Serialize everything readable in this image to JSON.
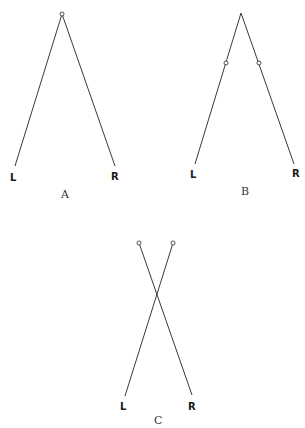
{
  "colors": {
    "line": "#3a3a3a",
    "text": "#1a1a1a",
    "background": "#ffffff"
  },
  "figures": [
    {
      "id": "A",
      "caption": "A",
      "left_label": "L",
      "right_label": "R",
      "description": "Two lines joined at a single pivot at the apex"
    },
    {
      "id": "B",
      "caption": "B",
      "left_label": "L",
      "right_label": "R",
      "description": "Two lines joined at the apex with a pivot on each line partway down"
    },
    {
      "id": "C",
      "caption": "C",
      "left_label": "L",
      "right_label": "R",
      "description": "Two crossing lines, each with a pivot at its top end"
    }
  ]
}
